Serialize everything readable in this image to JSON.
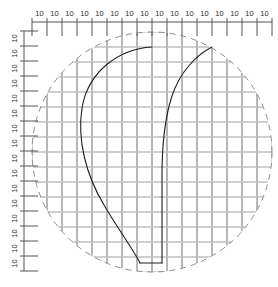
{
  "canvas": {
    "width": 278,
    "height": 287,
    "background": "#ffffff"
  },
  "colors": {
    "dimension_line": "#555555",
    "dimension_text": "#2b2b2b",
    "grid_vertical": "#6e6e6e",
    "grid_horizontal": "#bfbfbf",
    "boundary_dashed": "#8d8d8d",
    "curve": "#1f1f1f"
  },
  "top_ruler": {
    "name": "horizontal-dimension-ruler",
    "axis_y": 22,
    "x_start": 32,
    "x_end": 272,
    "tick_count": 17,
    "tick_spacing": 15,
    "tick_length": 14,
    "label_text": "10",
    "labels": [
      "10",
      "10",
      "10",
      "10",
      "10",
      "10",
      "10",
      "10",
      "10",
      "10",
      "10",
      "10",
      "10",
      "10",
      "10",
      "10"
    ]
  },
  "left_ruler": {
    "name": "vertical-dimension-ruler",
    "axis_x": 24,
    "y_start": 31,
    "y_end": 271,
    "tick_count": 17,
    "tick_spacing": 15,
    "tick_length": 14,
    "label_text": "10",
    "label_rotation": -90,
    "labels": [
      "10",
      "10",
      "10",
      "10",
      "10",
      "10",
      "10",
      "10",
      "10",
      "10",
      "10",
      "10",
      "10",
      "10",
      "10",
      "10"
    ]
  },
  "boundary": {
    "name": "dashed-circle-boundary",
    "shape": "circle",
    "cx": 152,
    "cy": 152,
    "r": 120,
    "dash": "6 5",
    "stroke_width": 1
  },
  "grid": {
    "name": "clipped-grid",
    "x_start": 32,
    "x_end": 272,
    "y_start": 32,
    "y_end": 272,
    "spacing": 15,
    "vertical_stroke_width": 1,
    "horizontal_stroke_width": 1.4
  },
  "curves": [
    {
      "name": "left-profile-curve",
      "path": "M 152 47 C 118 49 88 72 82 108 C 77 140 86 175 104 205 C 118 229 133 249 140 263"
    },
    {
      "name": "right-profile-curve",
      "path": "M 212 47 C 196 55 180 72 172 96 C 164 120 162 146 162 176 L 162 263"
    },
    {
      "name": "bottom-connector-segment",
      "path": "M 140 263 L 162 263"
    }
  ]
}
